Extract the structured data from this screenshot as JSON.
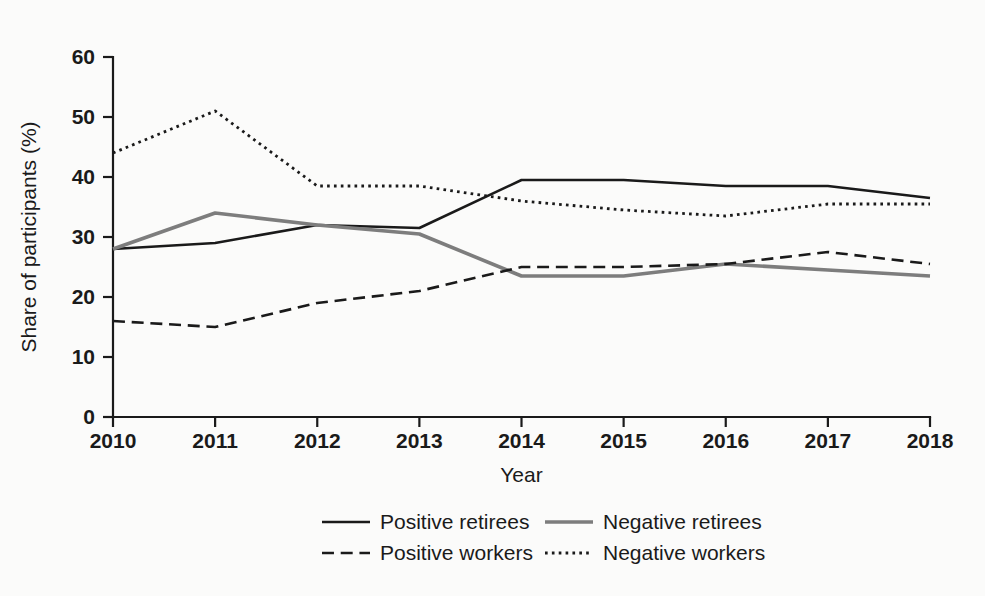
{
  "chart_data": {
    "type": "line",
    "title": "",
    "xlabel": "Year",
    "ylabel": "Share of participants (%)",
    "categories": [
      2010,
      2011,
      2012,
      2013,
      2014,
      2015,
      2016,
      2017,
      2018
    ],
    "x": [
      2010,
      2011,
      2012,
      2013,
      2014,
      2015,
      2016,
      2017,
      2018
    ],
    "xlim": [
      2010,
      2018
    ],
    "ylim": [
      0,
      60
    ],
    "y_ticks": [
      0,
      10,
      20,
      30,
      40,
      50,
      60
    ],
    "x_ticks": [
      2010,
      2011,
      2012,
      2013,
      2014,
      2015,
      2016,
      2017,
      2018
    ],
    "y_tick_labels": [
      "0",
      "10",
      "20",
      "30",
      "40",
      "50",
      "60"
    ],
    "x_tick_labels": [
      "2010",
      "2011",
      "2012",
      "2013",
      "2014",
      "2015",
      "2016",
      "2017",
      "2018"
    ],
    "grid": false,
    "legend_position": "bottom",
    "series": [
      {
        "name": "Positive retirees",
        "style": "solid",
        "color": "#1a1a1a",
        "width": 2.6,
        "values": [
          28,
          29,
          32,
          31.5,
          39.5,
          39.5,
          38.5,
          38.5,
          36.5
        ]
      },
      {
        "name": "Negative retirees",
        "style": "solid",
        "color": "#7d7d7d",
        "width": 3.6,
        "values": [
          28,
          34,
          32,
          30.5,
          23.5,
          23.5,
          25.5,
          24.5,
          23.5
        ]
      },
      {
        "name": "Positive workers",
        "style": "dashed",
        "color": "#1a1a1a",
        "width": 2.6,
        "values": [
          16,
          15,
          19,
          21,
          25,
          25,
          25.5,
          27.5,
          25.5
        ]
      },
      {
        "name": "Negative workers",
        "style": "dotted",
        "color": "#1a1a1a",
        "width": 2.8,
        "values": [
          44,
          51,
          38.5,
          38.5,
          36,
          34.5,
          33.5,
          35.5,
          35.5
        ]
      }
    ]
  },
  "legend": {
    "entries": [
      {
        "label": "Positive retirees"
      },
      {
        "label": "Negative retirees"
      },
      {
        "label": "Positive workers"
      },
      {
        "label": "Negative workers"
      }
    ]
  }
}
